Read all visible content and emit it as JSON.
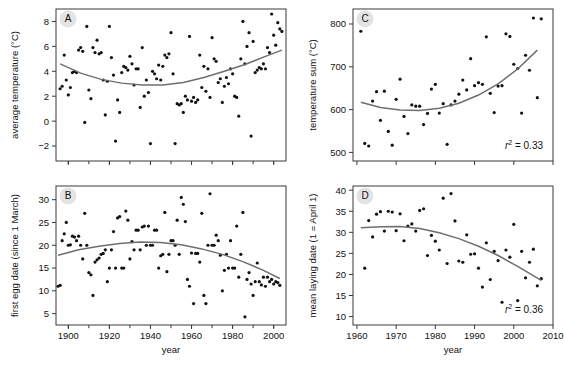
{
  "figure": {
    "panel_letters": [
      "A",
      "B",
      "C",
      "D"
    ],
    "shared_xlabel": "year"
  },
  "chart_data": [
    {
      "type": "scatter",
      "panel": "A",
      "title": "",
      "xlabel": "year",
      "ylabel": "average temperature (°C)",
      "xlim": [
        1894,
        2006
      ],
      "ylim": [
        -3.2,
        9.0
      ],
      "xticks": [
        1900,
        1920,
        1940,
        1960,
        1980,
        2000
      ],
      "xticklabels": [
        "",
        "",
        "",
        "",
        "",
        ""
      ],
      "yticks": [
        -2,
        0,
        2,
        4,
        6,
        8
      ],
      "yticklabels": [
        "−2",
        "0",
        "2",
        "4",
        "6",
        "8"
      ],
      "minor_xticks": [
        1900,
        1910,
        1920,
        1930,
        1940,
        1950,
        1960,
        1970,
        1980,
        1990,
        2000
      ],
      "grid": false,
      "legend": null,
      "annotation": "",
      "x": [
        1896,
        1897,
        1898,
        1899,
        1900,
        1901,
        1902,
        1903,
        1904,
        1905,
        1906,
        1907,
        1908,
        1909,
        1910,
        1911,
        1912,
        1913,
        1914,
        1915,
        1916,
        1917,
        1918,
        1919,
        1920,
        1921,
        1922,
        1923,
        1924,
        1925,
        1926,
        1927,
        1928,
        1929,
        1930,
        1931,
        1932,
        1933,
        1934,
        1935,
        1936,
        1937,
        1938,
        1939,
        1940,
        1941,
        1942,
        1943,
        1944,
        1945,
        1946,
        1947,
        1948,
        1949,
        1950,
        1951,
        1952,
        1953,
        1954,
        1955,
        1956,
        1957,
        1958,
        1959,
        1960,
        1961,
        1962,
        1963,
        1964,
        1965,
        1966,
        1967,
        1968,
        1969,
        1970,
        1971,
        1972,
        1973,
        1974,
        1975,
        1976,
        1977,
        1978,
        1979,
        1980,
        1981,
        1982,
        1983,
        1984,
        1985,
        1986,
        1987,
        1988,
        1989,
        1990,
        1991,
        1992,
        1993,
        1994,
        1995,
        1996,
        1997,
        1998,
        1999,
        2000,
        2001,
        2002,
        2003,
        2004
      ],
      "y": [
        2.6,
        2.8,
        5.3,
        3.3,
        2.1,
        2.7,
        3.9,
        4.0,
        3.9,
        5.7,
        5.9,
        5.6,
        -0.1,
        7.6,
        2.5,
        1.8,
        5.9,
        5.5,
        6.5,
        5.4,
        5.5,
        3.3,
        0.5,
        3.2,
        7.6,
        5.1,
        3.7,
        -1.6,
        1.7,
        0.7,
        3.9,
        4.4,
        4.3,
        4.1,
        5.2,
        4.6,
        2.9,
        4.2,
        4.2,
        1.1,
        5.9,
        2.0,
        3.3,
        2.3,
        -1.8,
        4.0,
        3.8,
        3.4,
        4.5,
        3.3,
        4.4,
        5.3,
        5.1,
        5.4,
        7.1,
        3.8,
        -1.8,
        1.4,
        1.3,
        1.4,
        0.7,
        2.0,
        1.7,
        6.8,
        1.6,
        1.9,
        1.5,
        1.7,
        5.3,
        2.7,
        4.4,
        2.4,
        4.2,
        1.9,
        6.7,
        5.0,
        4.8,
        3.1,
        3.4,
        1.5,
        2.8,
        3.5,
        3.0,
        4.2,
        3.8,
        2.0,
        1.9,
        0.4,
        5.0,
        8.0,
        4.6,
        6.0,
        7.1,
        -1.2,
        6.4,
        3.9,
        4.1,
        4.3,
        4.2,
        4.6,
        4.2,
        5.9,
        5.5,
        8.6,
        6.9,
        6.1,
        7.9,
        7.4,
        7.2
      ],
      "fit": {
        "type": "quadratic",
        "x_start": 1896,
        "x_end": 2004,
        "points": [
          [
            1896,
            4.6
          ],
          [
            1906,
            3.85
          ],
          [
            1916,
            3.35
          ],
          [
            1926,
            3.05
          ],
          [
            1936,
            2.9
          ],
          [
            1946,
            2.9
          ],
          [
            1956,
            3.1
          ],
          [
            1966,
            3.5
          ],
          [
            1976,
            4.0
          ],
          [
            1986,
            4.55
          ],
          [
            1996,
            5.2
          ],
          [
            2004,
            5.7
          ]
        ]
      }
    },
    {
      "type": "scatter",
      "panel": "B",
      "title": "",
      "xlabel": "year",
      "ylabel": "first egg date (since 1 March)",
      "xlim": [
        1894,
        2006
      ],
      "ylim": [
        2.5,
        33.0
      ],
      "xticks": [
        1900,
        1920,
        1940,
        1960,
        1980,
        2000
      ],
      "xticklabels": [
        "1900",
        "1920",
        "1940",
        "1960",
        "1980",
        "2000"
      ],
      "yticks": [
        5,
        10,
        15,
        20,
        25,
        30
      ],
      "yticklabels": [
        "5",
        "10",
        "15",
        "20",
        "25",
        "30"
      ],
      "minor_xticks": [
        1900,
        1910,
        1920,
        1930,
        1940,
        1950,
        1960,
        1970,
        1980,
        1990,
        2000
      ],
      "grid": false,
      "legend": null,
      "annotation": "",
      "x": [
        1895,
        1896,
        1897,
        1898,
        1899,
        1900,
        1901,
        1902,
        1903,
        1904,
        1905,
        1906,
        1907,
        1908,
        1909,
        1910,
        1911,
        1912,
        1913,
        1914,
        1915,
        1916,
        1917,
        1918,
        1919,
        1920,
        1921,
        1922,
        1923,
        1924,
        1925,
        1926,
        1927,
        1928,
        1929,
        1930,
        1931,
        1932,
        1933,
        1934,
        1935,
        1936,
        1937,
        1938,
        1939,
        1940,
        1941,
        1942,
        1943,
        1944,
        1945,
        1946,
        1947,
        1948,
        1949,
        1950,
        1951,
        1952,
        1953,
        1954,
        1955,
        1956,
        1957,
        1958,
        1959,
        1960,
        1961,
        1962,
        1963,
        1964,
        1965,
        1966,
        1967,
        1968,
        1969,
        1970,
        1971,
        1972,
        1973,
        1974,
        1975,
        1976,
        1977,
        1978,
        1979,
        1980,
        1981,
        1982,
        1983,
        1984,
        1985,
        1986,
        1987,
        1988,
        1989,
        1990,
        1991,
        1992,
        1993,
        1994,
        1995,
        1996,
        1997,
        1998,
        1999,
        2000,
        2001,
        2002,
        2003
      ],
      "y": [
        11.0,
        11.2,
        21.0,
        22.5,
        25.0,
        20.0,
        20.1,
        22.0,
        21.8,
        21.0,
        22.0,
        20.0,
        17.0,
        27.0,
        20.0,
        14.0,
        13.5,
        9.0,
        16.3,
        16.8,
        17.2,
        18.0,
        18.2,
        19.0,
        12.0,
        15.0,
        19.0,
        23.0,
        15.0,
        26.0,
        26.3,
        15.0,
        15.0,
        27.5,
        25.5,
        17.0,
        20.8,
        19.0,
        23.3,
        23.3,
        19.0,
        24.0,
        24.2,
        20.0,
        24.2,
        20.0,
        20.0,
        23.3,
        23.3,
        15.0,
        17.7,
        18.0,
        27.2,
        14.2,
        18.0,
        21.0,
        21.0,
        20.0,
        25.5,
        18.0,
        30.5,
        29.0,
        25.2,
        12.5,
        11.0,
        18.3,
        7.2,
        18.2,
        18.2,
        16.3,
        27.0,
        9.0,
        7.2,
        20.0,
        31.3,
        20.0,
        20.0,
        22.2,
        21.0,
        17.8,
        10.0,
        14.5,
        18.0,
        15.0,
        21.0,
        15.0,
        15.0,
        24.2,
        13.0,
        18.0,
        27.2,
        4.3,
        12.5,
        14.0,
        11.5,
        9.0,
        12.0,
        16.1,
        12.0,
        11.3,
        13.0,
        11.0,
        13.0,
        12.0,
        12.5,
        11.5,
        12.0,
        11.8,
        11.2
      ],
      "fit": {
        "type": "quadratic",
        "x_start": 1895,
        "x_end": 2003,
        "points": [
          [
            1895,
            17.8
          ],
          [
            1905,
            19.0
          ],
          [
            1915,
            19.8
          ],
          [
            1925,
            20.4
          ],
          [
            1935,
            20.7
          ],
          [
            1945,
            20.6
          ],
          [
            1955,
            20.1
          ],
          [
            1965,
            19.2
          ],
          [
            1975,
            18.0
          ],
          [
            1985,
            16.4
          ],
          [
            1995,
            14.5
          ],
          [
            2003,
            12.7
          ]
        ]
      }
    },
    {
      "type": "scatter",
      "panel": "C",
      "title": "",
      "xlabel": "year",
      "ylabel": "temperature sum (°C)",
      "xlim": [
        1959,
        2010
      ],
      "ylim": [
        480,
        835
      ],
      "xticks": [
        1960,
        1970,
        1980,
        1990,
        2000,
        2010
      ],
      "xticklabels": [
        "",
        "",
        "",
        "",
        "",
        ""
      ],
      "yticks": [
        500,
        600,
        700,
        800
      ],
      "yticklabels": [
        "500",
        "600",
        "700",
        "800"
      ],
      "grid": false,
      "legend": null,
      "annotation": "r2 = 0.33",
      "r_squared": 0.33,
      "x": [
        1961,
        1962,
        1963,
        1964,
        1965,
        1966,
        1967,
        1968,
        1969,
        1970,
        1971,
        1972,
        1973,
        1974,
        1975,
        1976,
        1977,
        1978,
        1979,
        1980,
        1981,
        1982,
        1983,
        1984,
        1985,
        1986,
        1987,
        1988,
        1989,
        1990,
        1991,
        1992,
        1993,
        1994,
        1995,
        1996,
        1997,
        1998,
        1999,
        2000,
        2001,
        2002,
        2003,
        2004,
        2005,
        2006,
        2007
      ],
      "y": [
        783,
        521,
        515,
        620,
        642,
        575,
        643,
        549,
        517,
        624,
        671,
        584,
        544,
        611,
        608,
        608,
        565,
        591,
        648,
        659,
        592,
        614,
        519,
        611,
        620,
        636,
        669,
        646,
        719,
        656,
        663,
        659,
        770,
        638,
        593,
        655,
        656,
        777,
        771,
        706,
        696,
        592,
        727,
        692,
        814,
        628,
        812
      ],
      "fit": {
        "type": "quadratic",
        "x_start": 1961,
        "x_end": 2006,
        "points": [
          [
            1961,
            617
          ],
          [
            1966,
            605
          ],
          [
            1971,
            599
          ],
          [
            1976,
            598
          ],
          [
            1981,
            603
          ],
          [
            1986,
            615
          ],
          [
            1991,
            634
          ],
          [
            1996,
            660
          ],
          [
            2001,
            695
          ],
          [
            2006,
            739
          ]
        ]
      }
    },
    {
      "type": "scatter",
      "panel": "D",
      "title": "",
      "xlabel": "year",
      "ylabel": "mean laying date (1 = April 1)",
      "xlim": [
        1959,
        2010
      ],
      "ylim": [
        8.0,
        41.0
      ],
      "xticks": [
        1960,
        1970,
        1980,
        1990,
        2000,
        2010
      ],
      "xticklabels": [
        "1960",
        "1970",
        "1980",
        "1990",
        "2000",
        "2010"
      ],
      "yticks": [
        10,
        15,
        20,
        25,
        30,
        35,
        40
      ],
      "yticklabels": [
        "10",
        "15",
        "20",
        "25",
        "30",
        "35",
        "40"
      ],
      "grid": false,
      "legend": null,
      "annotation": "r2 = 0.36",
      "r_squared": 0.36,
      "x": [
        1962,
        1963,
        1964,
        1965,
        1966,
        1967,
        1968,
        1969,
        1970,
        1971,
        1972,
        1973,
        1974,
        1975,
        1976,
        1977,
        1978,
        1979,
        1980,
        1981,
        1982,
        1983,
        1984,
        1985,
        1986,
        1987,
        1988,
        1989,
        1990,
        1991,
        1992,
        1993,
        1994,
        1995,
        1996,
        1997,
        1998,
        1999,
        2000,
        2001,
        2002,
        2003,
        2004,
        2005,
        2006,
        2007
      ],
      "y": [
        21.5,
        32.8,
        28.9,
        34.3,
        34.9,
        30.3,
        35.0,
        34.8,
        30.4,
        34.4,
        28.0,
        31.5,
        32.0,
        30.3,
        35.2,
        35.6,
        24.5,
        29.3,
        27.9,
        25.8,
        38.1,
        22.6,
        39.2,
        32.7,
        23.2,
        22.9,
        29.4,
        24.8,
        24.9,
        21.5,
        17.0,
        27.5,
        18.8,
        25.5,
        23.3,
        13.4,
        25.8,
        24.1,
        31.9,
        13.8,
        25.5,
        19.2,
        22.9,
        26.0,
        17.3,
        19.0
      ],
      "fit": {
        "type": "quadratic",
        "x_start": 1961,
        "x_end": 2007,
        "points": [
          [
            1961,
            31.1
          ],
          [
            1966,
            31.3
          ],
          [
            1971,
            31.4
          ],
          [
            1976,
            30.9
          ],
          [
            1981,
            29.9
          ],
          [
            1986,
            28.5
          ],
          [
            1991,
            26.7
          ],
          [
            1996,
            24.5
          ],
          [
            2001,
            21.9
          ],
          [
            2007,
            18.6
          ]
        ]
      }
    }
  ]
}
